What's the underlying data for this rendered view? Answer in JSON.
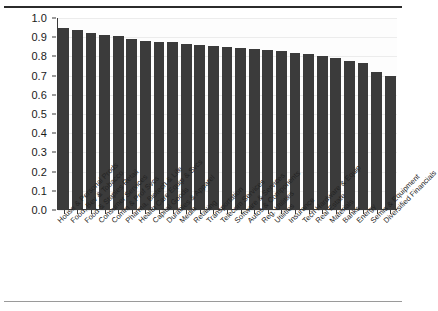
{
  "chart_data": {
    "type": "bar",
    "title": "",
    "subtitle": "",
    "xlabel": "",
    "ylabel": "",
    "ylim": [
      0.0,
      1.0
    ],
    "grid": true,
    "legend": null,
    "orientation": "vertical",
    "bar_color": "#3b3b3b",
    "ytick_labels": [
      "1.0",
      "0.9",
      "0.8",
      "0.7",
      "0.6",
      "0.5",
      "0.4",
      "0.3",
      "0.2",
      "0.1",
      "0.0"
    ],
    "ytick_values": [
      1.0,
      0.9,
      0.8,
      0.7,
      0.6,
      0.5,
      0.4,
      0.3,
      0.2,
      0.1,
      0.0
    ],
    "categories": [
      "House & Personal Prods",
      "Food, Bev & Tobacco",
      "Food & Staples Retail",
      "Consumer Services",
      "Comm & Prof Svcs",
      "Pharma, Biotech & Life",
      "Health Care Equip & Svcs",
      "Capital Goods",
      "Durables & Apparel",
      "Media",
      "Retailing",
      "Transportation",
      "Telecom Services",
      "Software & Services",
      "Autos & Components",
      "Reg. Utilities",
      "Utilities",
      "Insurance",
      "Tech Hardware & Equip",
      "Real Estate",
      "Materials",
      "Banks",
      "Energy",
      "Semis & Equipment",
      "Diversified Financials"
    ],
    "values": [
      0.95,
      0.94,
      0.92,
      0.91,
      0.905,
      0.89,
      0.88,
      0.875,
      0.875,
      0.865,
      0.86,
      0.855,
      0.85,
      0.845,
      0.84,
      0.835,
      0.83,
      0.82,
      0.815,
      0.8,
      0.79,
      0.775,
      0.765,
      0.72,
      0.7
    ]
  }
}
